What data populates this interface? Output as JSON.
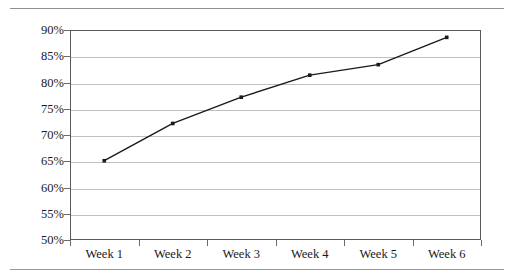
{
  "page": {
    "background_color": "#ffffff",
    "rule_color": "#8f8f8f"
  },
  "chart_data": {
    "type": "line",
    "title": "",
    "subtitle": "",
    "xlabel": "",
    "ylabel": "",
    "categories": [
      "Week 1",
      "Week 2",
      "Week 3",
      "Week 4",
      "Week 5",
      "Week 6"
    ],
    "series": [
      {
        "name": "",
        "values": [
          65.1,
          72.2,
          77.2,
          81.4,
          83.4,
          88.6
        ],
        "line_color": "#1a1a1a",
        "marker": "square",
        "marker_color": "#1a1a1a"
      }
    ],
    "ylim": [
      50,
      90
    ],
    "ytick_values": [
      50,
      55,
      60,
      65,
      70,
      75,
      80,
      85,
      90
    ],
    "ytick_labels": [
      "50%",
      "55%",
      "60%",
      "65%",
      "70%",
      "75%",
      "80%",
      "85%",
      "90%"
    ],
    "grid": true,
    "grid_axis": "y",
    "grid_color": "#bfbfbf",
    "legend": false,
    "legend_position": "none",
    "frame_color": "#5a5a5a",
    "annotations": []
  }
}
